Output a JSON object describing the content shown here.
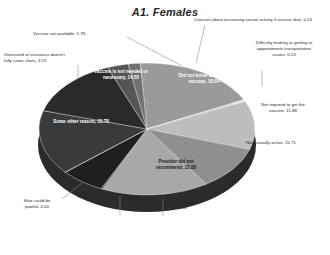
{
  "chart_data": {
    "type": "pie",
    "title": "A1. Females",
    "xlabel": "",
    "ylabel": "",
    "grid": false,
    "legend": "none",
    "labels": [
      "Did not know about the vaccine",
      "Concern about increasing sexual activity if receive shot",
      "Difficulty making or getting to appointments transportation issues",
      "Not required to get the vaccine",
      "Not sexually active",
      "Provider did not recommend",
      "Provider indicated could vaccinate later",
      "Safety concerns",
      "Shot could be painful",
      "Some other reason",
      "Vaccine is not needed or necessary",
      "Uninsured or insurance doesn't fully cover shots",
      "Vaccine not available"
    ],
    "categories": [
      "Did not know about the vaccine",
      "Concern about increasing sexual activity if receive shot",
      "Difficulty making or getting to appointments transportation issues",
      "Not required to get the vaccine",
      "Not sexually active",
      "Provider did not recommend",
      "Provider indicated could vaccinate later",
      "Safety concerns",
      "Shot could be painful",
      "Some other reason",
      "Vaccine is not needed or necessary",
      "Uninsured or insurance doesn't fully cover shots",
      "Vaccine not available"
    ],
    "values": [
      18.64,
      0.24,
      0.23,
      11.88,
      10.71,
      15.88,
      0.3,
      6.66,
      0.0,
      15.78,
      14.55,
      3.15,
      1.78
    ],
    "colors": [
      "#9a9a9a",
      "#d8d8d8",
      "#cfcfcf",
      "#bdbdbd",
      "#8f8f8f",
      "#a8a8a8",
      "#6d6d6d",
      "#1f1f1f",
      "#141414",
      "#3a3a3a",
      "#2a2a2a",
      "#555555",
      "#707070"
    ]
  },
  "chart": {
    "title": "A1. Females",
    "slices": [
      {
        "label": "Did not know about the vaccine",
        "value": "18.64",
        "text": "Did not know about the\nvaccine, 18.64"
      },
      {
        "label": "Concern about increasing sexual activity if receive shot",
        "value": "0.24",
        "text": "Concern about increasing sexual activity if receive shot, 0.24"
      },
      {
        "label": "Difficulty making or getting to appointments transportation issues",
        "value": "0.23",
        "text": "Difficulty making or getting to\nappointments transportation\nissues, 0.23"
      },
      {
        "label": "Not required to get the vaccine",
        "value": "11.88",
        "text": "Not required to get the\nvaccine, 11.88"
      },
      {
        "label": "Not sexually active",
        "value": "10.71",
        "text": "Not sexually active, 10.71"
      },
      {
        "label": "Provider did not recommend",
        "value": "15.88",
        "text": "Provider did not\nrecommend, 15.88"
      },
      {
        "label": "Provider indicated could vaccinate later",
        "value": "0.30",
        "text": "Provider indicated could\nvaccinate later, 0.30"
      },
      {
        "label": "Safety concerns",
        "value": "6.66",
        "text": "Safety concerns, 6.66"
      },
      {
        "label": "Shot could be painful",
        "value": "0.00",
        "text": "Shot could be\npainful, 0.00"
      },
      {
        "label": "Some other reason",
        "value": "15.78",
        "text": "Some other reason, 15.78"
      },
      {
        "label": "Vaccine is not needed or necessary",
        "value": "14.55",
        "text": "Vaccine is not needed or\nnecessary, 14.55"
      },
      {
        "label": "Uninsured or insurance doesn't fully cover shots",
        "value": "3.15",
        "text": "Uninsured or insurance doesn't\nfully cover shots, 3.15"
      },
      {
        "label": "Vaccine not available",
        "value": "1.78",
        "text": "Vaccine not available, 1.78"
      }
    ]
  }
}
